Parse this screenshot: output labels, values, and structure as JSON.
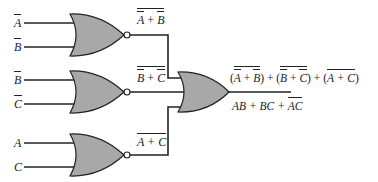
{
  "diagram": {
    "type": "logic-circuit",
    "colors": {
      "gate_fill": "#a8a8a8",
      "wire": "#222222",
      "background": "#ffffff"
    },
    "gates": [
      {
        "id": "nor1",
        "type": "NOR",
        "inputs": [
          "A̅",
          "B̅"
        ],
        "output_label": "A̅ + B̅ (overbar)"
      },
      {
        "id": "nor2",
        "type": "NOR",
        "inputs": [
          "B̅",
          "C̅"
        ],
        "output_label": "B̅ + C̅ (overbar)"
      },
      {
        "id": "nor3",
        "type": "NOR",
        "inputs": [
          "A",
          "C"
        ],
        "output_label": "A + C (overbar)"
      },
      {
        "id": "or1",
        "type": "OR",
        "inputs": [
          "nor1",
          "nor2",
          "nor3"
        ],
        "output_expression": "(A̅ + B̅)‾ + (B̅ + C̅)‾ + (A + C)‾",
        "simplified": "AB + BC + A̅C̅"
      }
    ],
    "input_labels": {
      "g1_a": "A",
      "g1_b": "B",
      "g2_a": "B",
      "g2_b": "C",
      "g3_a": "A",
      "g3_b": "C"
    },
    "output_labels": {
      "g1": {
        "left": "A",
        "op": " + ",
        "right": "B"
      },
      "g2": {
        "left": "B",
        "op": " + ",
        "right": "C"
      },
      "g3": {
        "text": "A + C"
      }
    },
    "final": {
      "t1_open": "(",
      "t1_a": "A",
      "t1_op": " + ",
      "t1_b": "B",
      "t1_close": ")",
      "plus1": " + ",
      "t2_open": "(",
      "t2_a": "B",
      "t2_op": " + ",
      "t2_b": "C",
      "t2_close": ")",
      "plus2": " + ",
      "t3_open": "(",
      "t3_inner": "A + C",
      "t3_close": ")",
      "simp_ab": "AB + BC + ",
      "simp_a": "A",
      "simp_c": "C"
    }
  }
}
